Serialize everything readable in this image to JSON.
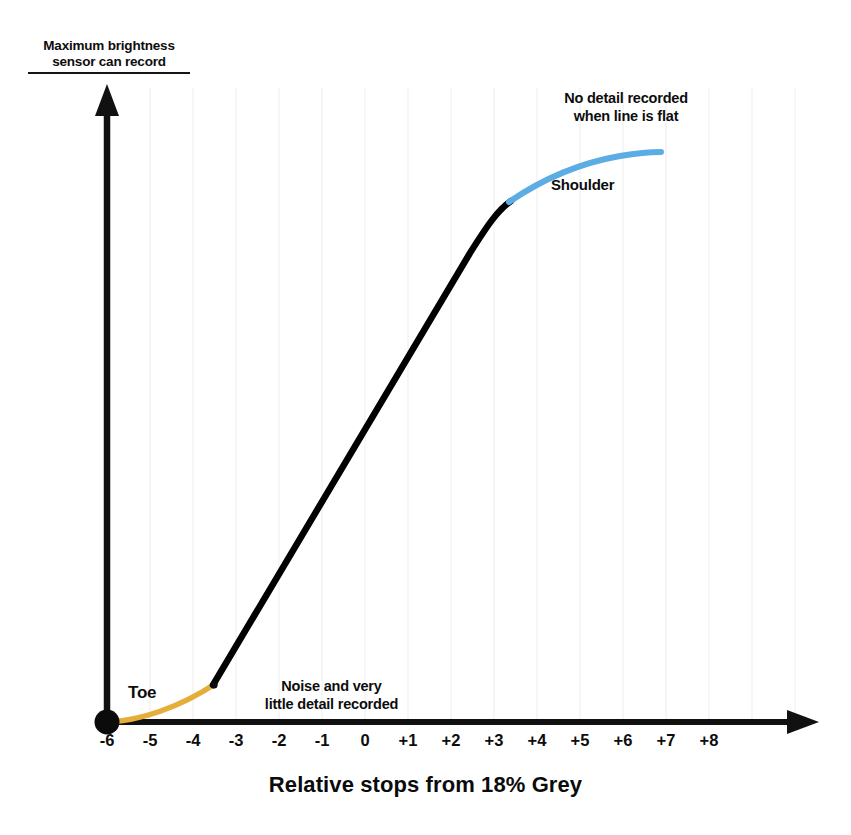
{
  "figure": {
    "y_axis_caption": "Maximum brightness\nsensor can record",
    "x_axis_title": "Relative stops from 18% Grey",
    "annotations": {
      "flat_note": "No detail recorded\nwhen line is flat",
      "shoulder": "Shoulder",
      "toe": "Toe",
      "noise_note": "Noise and very\nlittle detail recorded"
    },
    "colors": {
      "axis": "#111111",
      "straight_line": "#000000",
      "shoulder": "#5BADE4",
      "toe": "#E5AE3A",
      "gridline": "#f4f4f4",
      "background": "#ffffff"
    },
    "scan_artifact_text": "                                                                                   "
  },
  "chart_data": {
    "type": "line",
    "title": "",
    "subtitle": "",
    "xlabel": "Relative stops from 18% Grey",
    "ylabel": "Maximum brightness sensor can record",
    "xlim": [
      -6.5,
      9.0
    ],
    "ylim": [
      0,
      1
    ],
    "grid": true,
    "grid_axis": "x",
    "legend": "none",
    "tick_labels": [
      "-6",
      "-5",
      "-4",
      "-3",
      "-2",
      "-1",
      "0",
      "+1",
      "+2",
      "+3",
      "+4",
      "+5",
      "+6",
      "+7",
      "+8"
    ],
    "tick_values": [
      -6,
      -5,
      -4,
      -3,
      -2,
      -1,
      0,
      1,
      2,
      3,
      4,
      5,
      6,
      7,
      8
    ],
    "series": [
      {
        "name": "Toe",
        "color": "#E5AE3A",
        "points_px": [
          [
            107,
            722
          ],
          [
            130,
            718
          ],
          [
            155,
            711
          ],
          [
            180,
            701
          ],
          [
            200,
            692
          ],
          [
            214,
            684
          ]
        ],
        "points_data": [
          [
            -6.0,
            0.0
          ],
          [
            -5.47,
            0.006
          ],
          [
            -4.88,
            0.016
          ],
          [
            -4.3,
            0.033
          ],
          [
            -3.84,
            0.047
          ],
          [
            -3.51,
            0.059
          ]
        ]
      },
      {
        "name": "Straight line portion",
        "color": "#000000",
        "points_px": [
          [
            214,
            684
          ],
          [
            300,
            547
          ],
          [
            380,
            412
          ],
          [
            450,
            292
          ],
          [
            487,
            226
          ],
          [
            505,
            205
          ],
          [
            512,
            200
          ]
        ],
        "points_data": [
          [
            -3.51,
            0.059
          ],
          [
            -1.51,
            0.274
          ],
          [
            0.35,
            0.487
          ],
          [
            1.98,
            0.676
          ],
          [
            2.84,
            0.78
          ],
          [
            3.26,
            0.813
          ],
          [
            3.42,
            0.821
          ]
        ]
      },
      {
        "name": "Shoulder",
        "color": "#5BADE4",
        "points_px": [
          [
            512,
            200
          ],
          [
            540,
            183
          ],
          [
            570,
            170
          ],
          [
            600,
            161
          ],
          [
            630,
            155
          ],
          [
            660,
            152
          ]
        ],
        "points_data": [
          [
            3.42,
            0.821
          ],
          [
            4.07,
            0.848
          ],
          [
            4.77,
            0.868
          ],
          [
            5.47,
            0.882
          ],
          [
            6.16,
            0.892
          ],
          [
            6.86,
            0.896
          ]
        ]
      }
    ],
    "annotations": [
      {
        "text": "Toe",
        "at_px": [
          128,
          683
        ]
      },
      {
        "text": "Noise and very little detail recorded",
        "at_px": [
          229,
          678
        ]
      },
      {
        "text": "Shoulder",
        "at_px": [
          551,
          176
        ]
      },
      {
        "text": "No detail recorded when line is flat",
        "at_px": [
          512,
          90
        ]
      }
    ],
    "axes_px": {
      "origin": [
        107,
        722
      ],
      "x_axis_end": [
        818,
        722
      ],
      "y_axis_top": [
        107,
        85
      ],
      "tick_spacing_px": 43.0,
      "first_tick_px": 107
    }
  }
}
